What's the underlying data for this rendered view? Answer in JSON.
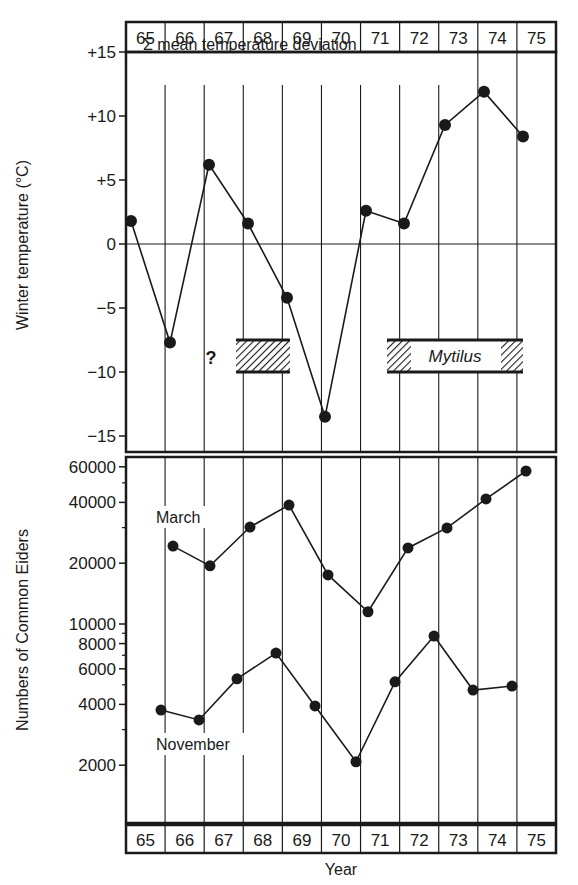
{
  "chart_data": [
    {
      "type": "line",
      "panel": "top",
      "title": "Σ mean temperature deviation",
      "xlabel": "Year",
      "ylabel": "Winter temperature (°C)",
      "ylim": [
        -15,
        15
      ],
      "y_scale": "linear",
      "y_ticks": [
        {
          "value": 15,
          "label": "+15"
        },
        {
          "value": 10,
          "label": "+10"
        },
        {
          "value": 5,
          "label": "+5"
        },
        {
          "value": 0,
          "label": "0"
        },
        {
          "value": -5,
          "label": "−5"
        },
        {
          "value": -10,
          "label": "−10"
        },
        {
          "value": -15,
          "label": "−15"
        }
      ],
      "categories": [
        "65",
        "66",
        "67",
        "68",
        "69",
        "70",
        "71",
        "72",
        "73",
        "74",
        "75"
      ],
      "series": [
        {
          "name": "Σ mean temperature deviation",
          "values": [
            1.8,
            -7.7,
            6.2,
            1.6,
            -4.2,
            -13.5,
            2.6,
            1.6,
            9.3,
            11.9,
            8.4
          ]
        }
      ],
      "grid": {
        "vertical": true,
        "zero_line": true
      },
      "annotations": [
        {
          "type": "hatched-bar",
          "x_from": 67.75,
          "x_to": 69.15,
          "y_from": -7.5,
          "y_to": -10,
          "label": ""
        },
        {
          "type": "text",
          "text": "?",
          "x": 67.1,
          "y": -8.8
        },
        {
          "type": "hatched-bar",
          "x_from": 71.6,
          "x_to": 75.05,
          "y_from": -7.5,
          "y_to": -10,
          "label": "Mytilus",
          "hatch_ends_only": true
        }
      ]
    },
    {
      "type": "line",
      "panel": "bottom",
      "title": "",
      "xlabel": "Year",
      "ylabel": "Numbers of Common Eiders",
      "y_scale": "log",
      "ylim": [
        1000,
        65000
      ],
      "y_ticks": [
        {
          "value": 60000,
          "label": "60000"
        },
        {
          "value": 40000,
          "label": "40000"
        },
        {
          "value": 20000,
          "label": "20000"
        },
        {
          "value": 10000,
          "label": "10000"
        },
        {
          "value": 8000,
          "label": "8000"
        },
        {
          "value": 6000,
          "label": "6000"
        },
        {
          "value": 4000,
          "label": "4000"
        },
        {
          "value": 2000,
          "label": "2000"
        }
      ],
      "categories": [
        "65",
        "66",
        "67",
        "68",
        "69",
        "70",
        "71",
        "72",
        "73",
        "74",
        "75"
      ],
      "series": [
        {
          "name": "March",
          "x": [
            "66",
            "67",
            "68",
            "69",
            "70",
            "71",
            "72",
            "73",
            "74",
            "75"
          ],
          "values": [
            24300,
            19400,
            30200,
            38800,
            17500,
            11500,
            23800,
            29900,
            41600,
            57200
          ]
        },
        {
          "name": "November",
          "x": [
            "65",
            "66",
            "67",
            "68",
            "69",
            "70",
            "71",
            "72",
            "73",
            "74"
          ],
          "values": [
            3750,
            3350,
            5350,
            7180,
            3930,
            2080,
            5170,
            8720,
            4710,
            4930
          ]
        }
      ],
      "legend": "inline labels near series"
    }
  ],
  "labels": {
    "top_title": "Σ mean temperature deviation",
    "top_ylabel": "Winter temperature (°C)",
    "bottom_ylabel": "Numbers of Common Eiders",
    "xlabel": "Year",
    "question_mark": "?",
    "mytilus": "Mytilus",
    "march": "March",
    "november": "November"
  },
  "years": [
    "65",
    "66",
    "67",
    "68",
    "69",
    "70",
    "71",
    "72",
    "73",
    "74",
    "75"
  ]
}
